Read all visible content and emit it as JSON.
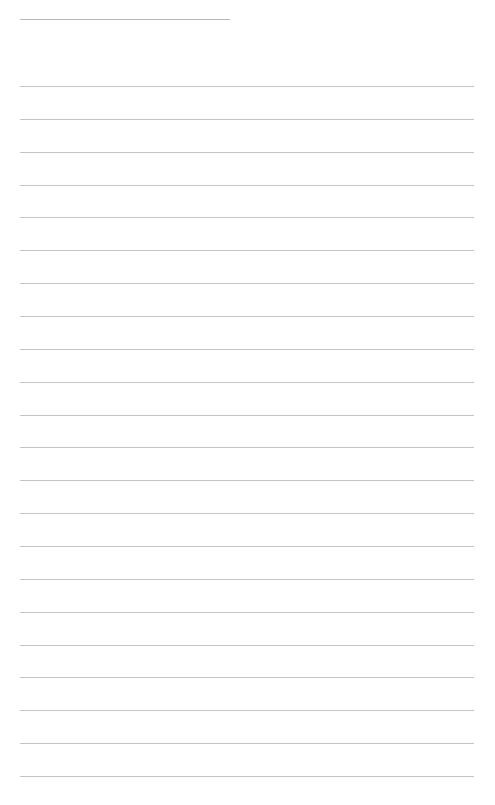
{
  "page": {
    "type": "ruled-sheet",
    "background": "#ffffff",
    "line_color": "#c4c4c4"
  },
  "title_line": {
    "text": ""
  },
  "lines": [
    {
      "text": ""
    },
    {
      "text": ""
    },
    {
      "text": ""
    },
    {
      "text": ""
    },
    {
      "text": ""
    },
    {
      "text": ""
    },
    {
      "text": ""
    },
    {
      "text": ""
    },
    {
      "text": ""
    },
    {
      "text": ""
    },
    {
      "text": ""
    },
    {
      "text": ""
    },
    {
      "text": ""
    },
    {
      "text": ""
    },
    {
      "text": ""
    },
    {
      "text": ""
    },
    {
      "text": ""
    },
    {
      "text": ""
    },
    {
      "text": ""
    },
    {
      "text": ""
    },
    {
      "text": ""
    },
    {
      "text": ""
    }
  ]
}
